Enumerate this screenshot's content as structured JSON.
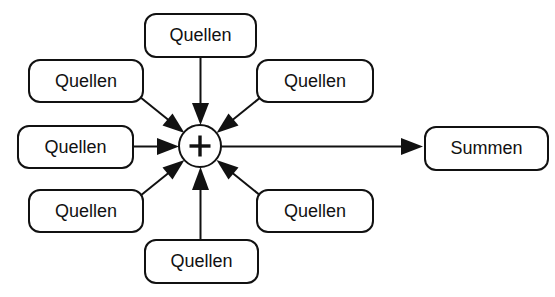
{
  "diagram": {
    "type": "summation-node-diagram",
    "canvas": {
      "width": 555,
      "height": 297,
      "background": "#ffffff"
    },
    "stroke_color": "#111111",
    "text_color": "#111111",
    "center_node": {
      "label": "+",
      "shape": "circle",
      "cx": 200,
      "cy": 146,
      "r": 21
    },
    "source_nodes": [
      {
        "id": "source-top",
        "label": "Quellen",
        "x": 145,
        "y": 14,
        "w": 111,
        "h": 43
      },
      {
        "id": "source-top-left",
        "label": "Quellen",
        "x": 29,
        "y": 60,
        "w": 114,
        "h": 42
      },
      {
        "id": "source-top-right",
        "label": "Quellen",
        "x": 257,
        "y": 60,
        "w": 116,
        "h": 42
      },
      {
        "id": "source-left",
        "label": "Quellen",
        "x": 18,
        "y": 126,
        "w": 115,
        "h": 42
      },
      {
        "id": "source-bottom-left",
        "label": "Quellen",
        "x": 29,
        "y": 190,
        "w": 114,
        "h": 42
      },
      {
        "id": "source-bottom-right",
        "label": "Quellen",
        "x": 257,
        "y": 190,
        "w": 116,
        "h": 42
      },
      {
        "id": "source-bottom",
        "label": "Quellen",
        "x": 145,
        "y": 240,
        "w": 113,
        "h": 43
      }
    ],
    "output_node": {
      "id": "output-summen",
      "label": "Summen",
      "x": 425,
      "y": 127,
      "w": 123,
      "h": 43
    },
    "edges": [
      {
        "id": "edge-top-to-sum",
        "from": "source-top",
        "to": "center-node",
        "direction": "down"
      },
      {
        "id": "edge-top-left-to-sum",
        "from": "source-top-left",
        "to": "center-node",
        "direction": "down-right"
      },
      {
        "id": "edge-top-right-to-sum",
        "from": "source-top-right",
        "to": "center-node",
        "direction": "down-left"
      },
      {
        "id": "edge-left-to-sum",
        "from": "source-left",
        "to": "center-node",
        "direction": "right"
      },
      {
        "id": "edge-bottom-left-to-sum",
        "from": "source-bottom-left",
        "to": "center-node",
        "direction": "up-right"
      },
      {
        "id": "edge-bottom-right-to-sum",
        "from": "source-bottom-right",
        "to": "center-node",
        "direction": "up-left"
      },
      {
        "id": "edge-bottom-to-sum",
        "from": "source-bottom",
        "to": "center-node",
        "direction": "up"
      },
      {
        "id": "edge-sum-to-output",
        "from": "center-node",
        "to": "output-summen",
        "direction": "right"
      }
    ]
  }
}
